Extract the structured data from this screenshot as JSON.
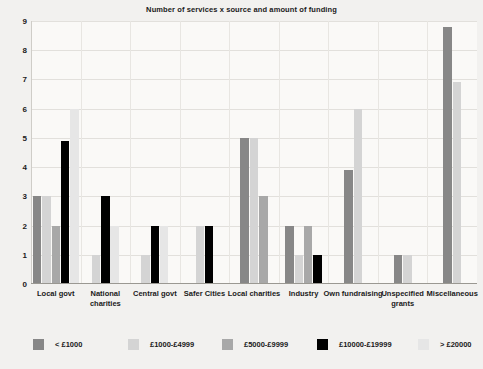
{
  "chart_data": {
    "type": "bar",
    "title": "Number of services x source and amount of funding",
    "xlabel": "",
    "ylabel": "",
    "ylim": [
      0,
      9
    ],
    "yticks": [
      0,
      1,
      2,
      3,
      4,
      5,
      6,
      7,
      8,
      9
    ],
    "grid": true,
    "legend_position": "bottom",
    "categories": [
      "Local govt",
      "National charities",
      "Central govt",
      "Safer Cities",
      "Local charities",
      "Industry",
      "Own fundraising",
      "Unspecified grants",
      "Miscellaneous"
    ],
    "series": [
      {
        "name": "< £1000",
        "color": "#878787",
        "values": [
          3,
          0,
          0,
          0,
          5,
          2,
          3.9,
          1,
          8.8
        ]
      },
      {
        "name": "£1000-£4999",
        "color": "#d4d4d4",
        "values": [
          3,
          1,
          1,
          2,
          5,
          1,
          6,
          1,
          6.9
        ]
      },
      {
        "name": "£5000-£9999",
        "color": "#a8a8a8",
        "values": [
          2,
          0,
          0,
          0,
          3,
          2,
          0,
          0,
          0
        ]
      },
      {
        "name": "£10000-£19999",
        "color": "#000000",
        "values": [
          4.9,
          3,
          2,
          2,
          0,
          1,
          0,
          0,
          0
        ]
      },
      {
        "name": "> £20000",
        "color": "#e6e6e6",
        "values": [
          6,
          2,
          2,
          0,
          0,
          0,
          0,
          0,
          0
        ]
      }
    ]
  },
  "style": {
    "background": "#f2f1ef",
    "plot_background": "#faf9f7",
    "grid_color": "#e2e0dc",
    "axis_color": "#9a9892",
    "text_color": "#1a1a1a"
  }
}
